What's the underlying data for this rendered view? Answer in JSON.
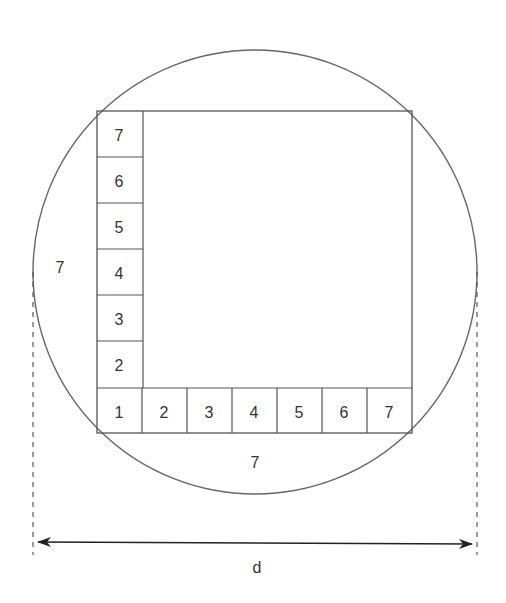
{
  "diagram": {
    "colors": {
      "stroke": "#555555",
      "text": "#333333",
      "background": "#ffffff"
    },
    "vertical_column_labels": [
      "7",
      "6",
      "5",
      "4",
      "3",
      "2"
    ],
    "bottom_row_labels": [
      "1",
      "2",
      "3",
      "4",
      "5",
      "6",
      "7"
    ],
    "left_side_label": "7",
    "bottom_side_label": "7",
    "diameter_label": "d"
  }
}
